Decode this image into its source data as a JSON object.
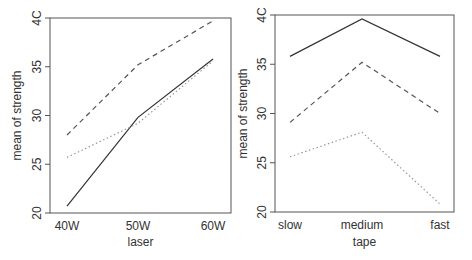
{
  "chart_data": [
    {
      "type": "line",
      "title": "",
      "xlabel": "laser",
      "ylabel": "mean of  strength",
      "categories": [
        "40W",
        "50W",
        "60W"
      ],
      "ylim": [
        20,
        40
      ],
      "yticks": [
        20,
        25,
        30,
        35,
        40
      ],
      "ytick_labels": [
        "20",
        "25",
        "30",
        "35",
        "4C"
      ],
      "grid": false,
      "legend": "none",
      "series": [
        {
          "name": "solid",
          "style": "solid",
          "values": [
            20.7,
            29.8,
            35.8
          ]
        },
        {
          "name": "dashed",
          "style": "dashed",
          "values": [
            28.0,
            35.2,
            39.7
          ]
        },
        {
          "name": "dotted",
          "style": "dotted",
          "values": [
            25.7,
            29.2,
            35.6
          ]
        }
      ]
    },
    {
      "type": "line",
      "title": "",
      "xlabel": "tape",
      "ylabel": "mean of  strength",
      "categories": [
        "slow",
        "medium",
        "fast"
      ],
      "ylim": [
        20,
        40
      ],
      "yticks": [
        20,
        25,
        30,
        35,
        40
      ],
      "ytick_labels": [
        "20",
        "25",
        "30",
        "35",
        "4C"
      ],
      "grid": false,
      "legend": "none",
      "series": [
        {
          "name": "solid",
          "style": "solid",
          "values": [
            35.8,
            39.6,
            35.8
          ]
        },
        {
          "name": "dashed",
          "style": "dashed",
          "values": [
            29.1,
            35.2,
            30.0
          ]
        },
        {
          "name": "dotted",
          "style": "dotted",
          "values": [
            25.6,
            28.1,
            20.8
          ]
        }
      ]
    }
  ],
  "colors": {
    "axis": "#555555",
    "solid": "#333333",
    "dashed": "#555555",
    "dotted": "#999999"
  }
}
